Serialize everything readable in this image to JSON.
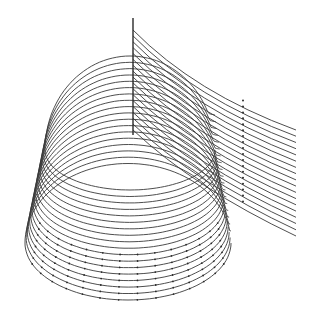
{
  "figure": {
    "width": 314,
    "height": 320,
    "background": "#ffffff",
    "stroke_color": "#3a3a3a",
    "band": {
      "line_count": 18,
      "bottom": {
        "cx": 128,
        "cy": 243,
        "rx": 103,
        "ry": 57
      },
      "top": {
        "cx": 130,
        "cy": 150,
        "rx": 85,
        "ry": 40
      }
    },
    "ribbon": {
      "line_count": 18,
      "start_x": 133,
      "start_y_top": 30,
      "start_y_bottom": 130,
      "end_x": 296,
      "end_y_top": 130,
      "end_y_bottom": 236
    },
    "mast": {
      "x": 133,
      "y_top": 18,
      "y_bottom": 135
    }
  }
}
